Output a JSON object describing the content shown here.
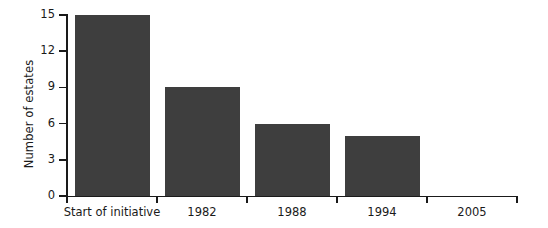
{
  "chart_data": {
    "type": "bar",
    "title": "",
    "xlabel": "",
    "ylabel": "Number of estates",
    "categories": [
      "Start of initiative",
      "1982",
      "1988",
      "1994",
      "2005"
    ],
    "values": [
      15,
      9,
      6,
      5,
      0
    ],
    "ylim": [
      0,
      15
    ],
    "yticks": [
      0,
      3,
      6,
      9,
      12,
      15
    ],
    "ytick_labels": [
      "0",
      "3",
      "6",
      "9",
      "12",
      "15"
    ],
    "grid": false,
    "legend": null,
    "bar_color": "#3e3e3e",
    "axis_color": "#1a1a1a",
    "background": "#ffffff"
  },
  "axis": {
    "y_title": "Number of estates"
  }
}
